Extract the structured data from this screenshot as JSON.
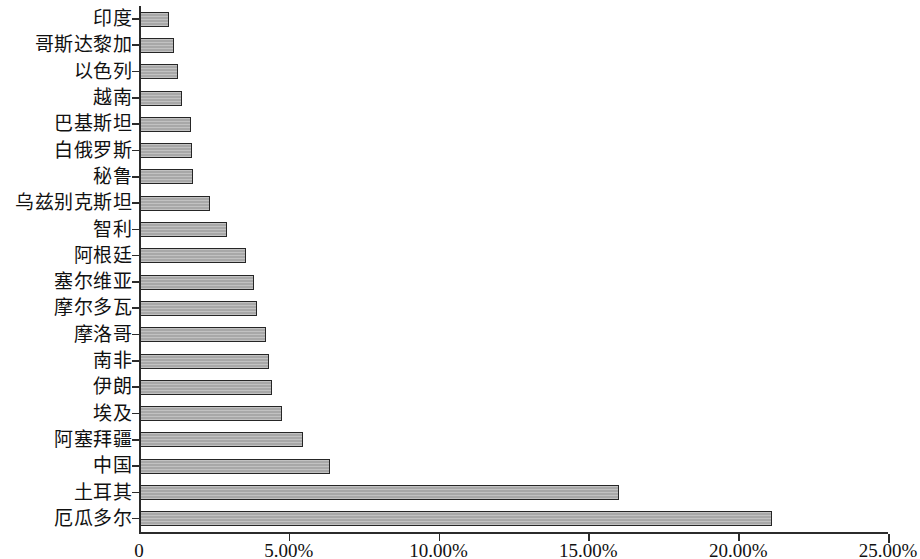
{
  "chart_data": {
    "type": "bar",
    "orientation": "horizontal",
    "title": "",
    "subtitle": "",
    "xlabel": "",
    "ylabel": "",
    "grid": false,
    "legend": null,
    "xlim": [
      0,
      25
    ],
    "xtick_labels": [
      "0",
      "5.00%",
      "10.00%",
      "15.00%",
      "20.00%",
      "25.00%"
    ],
    "xtick_values": [
      0,
      5,
      10,
      15,
      20,
      25
    ],
    "unit": "%",
    "bar_color": "#a8a8a8",
    "bar_edge_color": "#262626",
    "axis_color": "#2b2b2b",
    "categories": [
      "印度",
      "哥斯达黎加",
      "以色列",
      "越南",
      "巴基斯坦",
      "白俄罗斯",
      "秘鲁",
      "乌兹别克斯坦",
      "智利",
      "阿根廷",
      "塞尔维亚",
      "摩尔多瓦",
      "摩洛哥",
      "南非",
      "伊朗",
      "埃及",
      "阿塞拜疆",
      "中国",
      "土耳其",
      "厄瓜多尔"
    ],
    "values": [
      0.97,
      1.13,
      1.27,
      1.4,
      1.7,
      1.73,
      1.77,
      2.33,
      2.9,
      3.55,
      3.8,
      3.9,
      4.2,
      4.3,
      4.4,
      4.75,
      5.45,
      6.35,
      16.0,
      21.1
    ]
  }
}
